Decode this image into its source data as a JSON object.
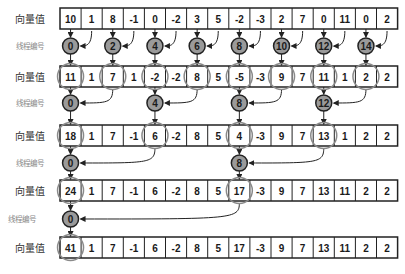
{
  "labels": {
    "vector_value": "向量值",
    "thread_id": "线程编号"
  },
  "colors": {
    "border": "#222222",
    "circle_fill": "#9a9a9a",
    "highlight_ellipse": "#8a8a8a",
    "arrow": "#222222"
  },
  "rows": [
    {
      "values": [
        10,
        1,
        8,
        -1,
        0,
        -2,
        3,
        5,
        -2,
        -3,
        2,
        7,
        0,
        11,
        0,
        2
      ],
      "highlighted": []
    },
    {
      "values": [
        11,
        1,
        7,
        1,
        -2,
        -2,
        8,
        5,
        -5,
        -3,
        9,
        7,
        11,
        1,
        2,
        2
      ],
      "highlighted": [
        0,
        2,
        4,
        6,
        8,
        10,
        12,
        14
      ]
    },
    {
      "values": [
        18,
        1,
        7,
        -1,
        6,
        -2,
        8,
        5,
        4,
        -3,
        9,
        7,
        13,
        1,
        2,
        2
      ],
      "highlighted": [
        0,
        4,
        8,
        12
      ]
    },
    {
      "values": [
        24,
        1,
        7,
        -1,
        6,
        -2,
        8,
        5,
        17,
        -3,
        9,
        7,
        13,
        11,
        2,
        2
      ],
      "highlighted": [
        0,
        8
      ]
    },
    {
      "values": [
        41,
        1,
        7,
        -1,
        6,
        -2,
        8,
        5,
        17,
        -3,
        9,
        7,
        13,
        11,
        2,
        2
      ],
      "highlighted": [
        0
      ]
    }
  ],
  "steps": [
    {
      "threads": [
        0,
        2,
        4,
        6,
        8,
        10,
        12,
        14
      ],
      "stride": 1
    },
    {
      "threads": [
        0,
        4,
        8,
        12
      ],
      "stride": 2
    },
    {
      "threads": [
        0,
        8
      ],
      "stride": 4
    },
    {
      "threads": [
        0
      ],
      "stride": 8
    }
  ]
}
